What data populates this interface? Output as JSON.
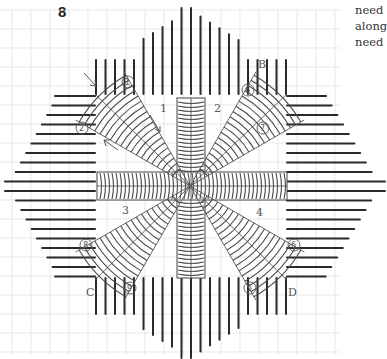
{
  "figure": {
    "number": "8"
  },
  "side_text": [
    "need",
    "along",
    "need"
  ],
  "corner_labels": [
    "B",
    "C",
    "D"
  ],
  "section_labels": [
    "1",
    "2",
    "3",
    "4"
  ],
  "start_points": [
    "1",
    "2",
    "6",
    "7",
    "8",
    "9",
    "5",
    "6"
  ],
  "colors": {
    "stitch": "#2a2a2a",
    "grid": "#d9d9d9",
    "pencil": "#555555"
  },
  "chart_data": {
    "type": "diagram",
    "title": "8",
    "center": [
      190,
      186
    ],
    "sections": [
      "1",
      "2",
      "3",
      "4"
    ],
    "corners": {
      "B": [
        255,
        82
      ],
      "C": [
        98,
        282
      ],
      "D": [
        285,
        282
      ]
    }
  }
}
